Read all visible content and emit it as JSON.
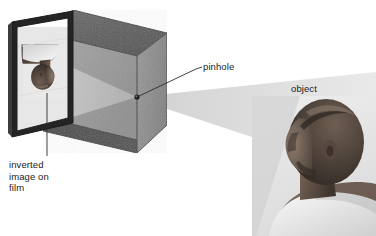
{
  "diagram": {
    "background_color": "#ffffff",
    "labels": {
      "pinhole": "pinhole",
      "object": "object",
      "inverted_image": "inverted\nimage on\nfilm"
    },
    "colors": {
      "box_top_face": "#5c5c5c",
      "box_right_face": "#8d8d8d",
      "box_front_face": "#8a8a8a",
      "box_interior_bottom": "#4b4b4b",
      "box_interior_back": "#9a9a9a",
      "film_frame": "#2b2b2b",
      "light_cone_outside": "#e2e2e2",
      "light_cone_inside": "#b4b4b4",
      "leader_line": "#3a3a3a",
      "label_text": "#1a1a1a",
      "skin_dark": "#3b332e",
      "skin_mid": "#6b5a50",
      "skin_light": "#b3a396",
      "shirt_white": "#efefef"
    },
    "parts": {
      "box": "pinhole-camera-box",
      "film_panel": "film-panel-with-inverted-image",
      "pinhole_dot": "pinhole-aperture",
      "light_cone": "light-ray-cone",
      "subject": "person-photograph-object",
      "inverted_image": "inverted-person-image-on-film"
    },
    "geometry": {
      "pinhole_point": [
        137,
        97
      ],
      "pinhole_leader": "137,97 196,68 202,66",
      "film_leader": "47,96 47,155",
      "box_top_face": "73,10 167,33 137,56 43,33",
      "box_right_face": "167,33 167,125 137,153 137,56",
      "box_interior_bottom": "43,117 137,140 137,153 43,131",
      "box_interior_back": "137,56 137,140 43,117 43,33",
      "film_outer": "12,22 73,22 73,123 12,137",
      "film_inner": "17,27 68,27 68,118 17,131",
      "cone_outside": "137,97 376,74 376,175",
      "cone_inside": "137,97 43,62 43,128"
    }
  }
}
